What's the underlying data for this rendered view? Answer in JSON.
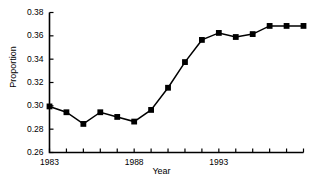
{
  "chart_data": {
    "type": "line",
    "title": "",
    "xlabel": "Year",
    "ylabel": "Proportion",
    "x": [
      1983,
      1984,
      1985,
      1986,
      1987,
      1988,
      1989,
      1990,
      1991,
      1992,
      1993,
      1994,
      1995,
      1996,
      1997,
      1998
    ],
    "values": [
      0.2995,
      0.2945,
      0.2845,
      0.2945,
      0.2905,
      0.2865,
      0.2965,
      0.3155,
      0.3375,
      0.3565,
      0.3625,
      0.359,
      0.3615,
      0.3685,
      0.3685,
      0.3685
    ],
    "series": [
      {
        "name": "Proportion",
        "values": [
          0.2995,
          0.2945,
          0.2845,
          0.2945,
          0.2905,
          0.2865,
          0.2965,
          0.3155,
          0.3375,
          0.3565,
          0.3625,
          0.359,
          0.3615,
          0.3685,
          0.3685,
          0.3685
        ],
        "marker": "filled-square",
        "color": "#000000"
      }
    ],
    "xlim": [
      1983,
      1998
    ],
    "ylim": [
      0.26,
      0.38
    ],
    "ytick_values": [
      0.26,
      0.28,
      0.3,
      0.32,
      0.34,
      0.36,
      0.38
    ],
    "ytick_labels": [
      "0.26",
      "0.28",
      "0.30",
      "0.32",
      "0.34",
      "0.36",
      "0.38"
    ],
    "xtick_values": [
      1983,
      1984,
      1985,
      1986,
      1987,
      1988,
      1989,
      1990,
      1991,
      1992,
      1993,
      1994,
      1995,
      1996,
      1997,
      1998
    ],
    "xtick_labels_shown": [
      {
        "value": 1983,
        "label": "1983"
      },
      {
        "value": 1988,
        "label": "1988"
      },
      {
        "value": 1993,
        "label": "1993"
      }
    ],
    "grid": false,
    "legend": null,
    "axes_style": "left-and-bottom-spines",
    "line_color": "#000000",
    "background_color": "#ffffff"
  }
}
